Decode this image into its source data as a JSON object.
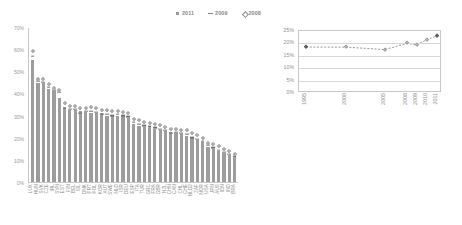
{
  "legend": {
    "items": [
      {
        "label": "2011",
        "marker": "square"
      },
      {
        "label": "2009",
        "marker": "dash"
      },
      {
        "label": "2008",
        "marker": "diamond"
      }
    ]
  },
  "chart_data": [
    {
      "type": "bar",
      "name": "main-chart",
      "title": "",
      "xlabel": "",
      "ylabel": "",
      "ylim": [
        0,
        70
      ],
      "ytick_labels": [
        "0%",
        "10%",
        "20%",
        "30%",
        "40%",
        "50%",
        "60%",
        "70%"
      ],
      "ytick_values": [
        0,
        10,
        20,
        30,
        40,
        50,
        60,
        70
      ],
      "grid": false,
      "legend_position": "top-center",
      "categories": [
        "LUX",
        "HUN",
        "SVK",
        "CZE",
        "IRL",
        "SVN",
        "EST",
        "FIN",
        "BEL",
        "ISL",
        "DNK",
        "PRT",
        "POL",
        "KOR",
        "AUT",
        "SWE",
        "NLD",
        "ISR",
        "DEU",
        "ESP",
        "ITA",
        "TUR",
        "GRC",
        "FRA",
        "GBR",
        "NZL",
        "CHN",
        "CAN",
        "CHL",
        "CHE",
        "NLD2",
        "ZAF",
        "NOR",
        "USA",
        "JPN",
        "AUS",
        "IDN",
        "IND",
        "BRA"
      ],
      "series": [
        {
          "name": "2011",
          "marker": "bar",
          "values": [
            55.0,
            44.5,
            44.5,
            42.0,
            41.0,
            38.0,
            34.0,
            32.5,
            32.5,
            32.0,
            31.5,
            31.0,
            31.0,
            31.0,
            30.0,
            30.0,
            30.0,
            30.0,
            29.0,
            26.0,
            25.5,
            25.0,
            24.5,
            24.0,
            23.5,
            23.0,
            22.5,
            22.0,
            21.5,
            21.0,
            20.5,
            19.0,
            18.0,
            16.0,
            15.0,
            14.0,
            13.0,
            12.0,
            11.0
          ]
        },
        {
          "name": "2009",
          "marker": "dash",
          "values": [
            57.0,
            45.5,
            45.0,
            43.0,
            41.5,
            40.5,
            33.5,
            33.0,
            33.0,
            31.0,
            32.0,
            32.0,
            31.5,
            30.5,
            30.5,
            30.0,
            30.5,
            30.0,
            29.5,
            27.0,
            26.0,
            25.5,
            25.0,
            24.5,
            24.0,
            23.5,
            22.0,
            22.5,
            22.0,
            21.5,
            20.0,
            19.5,
            18.5,
            16.5,
            15.5,
            14.5,
            13.5,
            12.5,
            11.5
          ]
        },
        {
          "name": "2008",
          "marker": "diamond",
          "values": [
            59.0,
            46.5,
            46.5,
            44.0,
            42.5,
            41.5,
            35.5,
            34.5,
            34.5,
            33.5,
            33.5,
            34.0,
            33.5,
            32.5,
            32.5,
            32.0,
            32.0,
            31.5,
            31.0,
            28.5,
            28.0,
            27.0,
            26.5,
            26.0,
            25.5,
            25.0,
            24.0,
            24.0,
            23.5,
            23.5,
            22.0,
            21.0,
            20.0,
            17.5,
            17.0,
            16.0,
            15.0,
            14.0,
            12.5
          ]
        }
      ]
    },
    {
      "type": "line",
      "name": "inset-chart",
      "title": "",
      "xlabel": "",
      "ylabel": "",
      "ylim": [
        0,
        25
      ],
      "ytick_labels": [
        "0%",
        "5%",
        "10%",
        "15%",
        "20%",
        "25%"
      ],
      "ytick_values": [
        0,
        5,
        10,
        15,
        20,
        25
      ],
      "grid": true,
      "legend_position": "none",
      "categories": [
        "1995",
        "2000",
        "2005",
        "2008",
        "2009",
        "2010",
        "2011"
      ],
      "series": [
        {
          "name": "OECD total",
          "marker": "diamond",
          "values": [
            18.5,
            18.5,
            17.5,
            20.0,
            19.5,
            21.5,
            23.0
          ],
          "marker_styles": [
            "filled",
            "open",
            "open",
            "open",
            "open",
            "open",
            "filled"
          ]
        }
      ]
    }
  ]
}
